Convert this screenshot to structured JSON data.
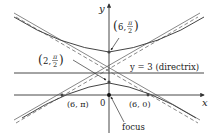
{
  "diagram": {
    "type": "hyperbola-polar-conic",
    "axes": {
      "x_label": "x",
      "y_label": "y",
      "origin_label": "0"
    },
    "directrix": {
      "label": "y = 3 (directrix)"
    },
    "points": [
      {
        "id": "upper-vertex",
        "label_main": "(6, ",
        "frac_num": "π",
        "frac_den": "2",
        "label_close": ")"
      },
      {
        "id": "lower-vertex",
        "label_main": "(2, ",
        "frac_num": "π",
        "frac_den": "2",
        "label_close": ")"
      },
      {
        "id": "left-x-intercept",
        "label": "(6, π)"
      },
      {
        "id": "right-x-intercept",
        "label": "(6, 0)"
      },
      {
        "id": "focus",
        "label": "focus"
      }
    ],
    "colors": {
      "curve": "#444444",
      "axis": "#333333",
      "dash": "#555555"
    }
  }
}
